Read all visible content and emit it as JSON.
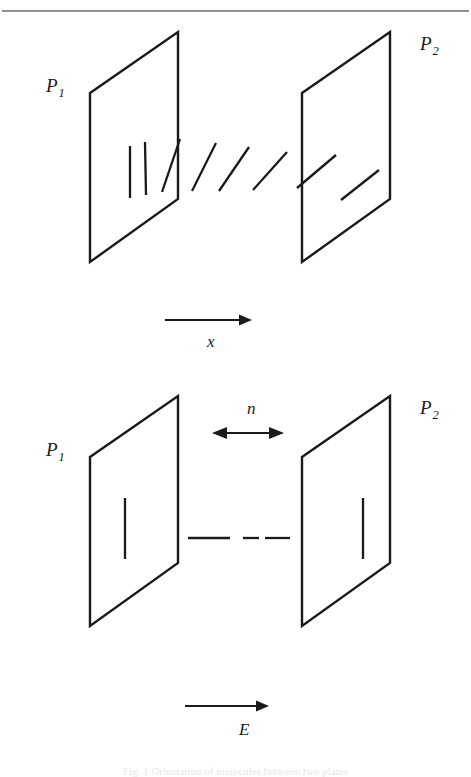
{
  "figure": {
    "width": 471,
    "height": 777,
    "background": "#ffffff",
    "ink_color": "#1a1a1a",
    "rule_color": "#6e6e6e",
    "top_rule": {
      "y": 11,
      "x1": 2,
      "x2": 469
    },
    "cut_caption": {
      "text": "Fig. 1   Orientation of molecules between two plates",
      "y": 765
    }
  },
  "panels": [
    {
      "id": "top-panel",
      "name": "splayed-orientation-panel",
      "plane_left": {
        "label": "P",
        "subscript": "1",
        "label_x": 46,
        "label_y": 92,
        "points": "90,93 178,32 178,199 90,262"
      },
      "plane_right": {
        "label": "P",
        "subscript": "2",
        "label_x": 420,
        "label_y": 50,
        "points": "302,93 390,32 390,199 302,262"
      },
      "axis_arrow": {
        "label": "x",
        "label_x": 207,
        "label_y": 347,
        "x1": 165,
        "x2": 245,
        "y": 320
      },
      "molecules": [
        {
          "x1": 130,
          "y1": 146,
          "x2": 130,
          "y2": 198,
          "angle_deg": 0
        },
        {
          "x1": 145,
          "y1": 142,
          "x2": 146,
          "y2": 195,
          "angle_deg": 1
        },
        {
          "x1": 162,
          "y1": 192,
          "x2": 180,
          "y2": 139,
          "angle_deg": 19
        },
        {
          "x1": 192,
          "y1": 191,
          "x2": 216,
          "y2": 143,
          "angle_deg": 27
        },
        {
          "x1": 219,
          "y1": 191,
          "x2": 249,
          "y2": 147,
          "angle_deg": 34
        },
        {
          "x1": 253,
          "y1": 190,
          "x2": 287,
          "y2": 152,
          "angle_deg": 42
        },
        {
          "x1": 297,
          "y1": 188,
          "x2": 336,
          "y2": 155,
          "angle_deg": 40
        },
        {
          "x1": 341,
          "y1": 200,
          "x2": 379,
          "y2": 170,
          "angle_deg": 38
        }
      ]
    },
    {
      "id": "bottom-panel",
      "name": "aligned-field-panel",
      "plane_left": {
        "label": "P",
        "subscript": "1",
        "label_x": 46,
        "label_y": 456,
        "points": "90,457 178,396 178,563 90,626"
      },
      "plane_right": {
        "label": "P",
        "subscript": "2",
        "label_x": 420,
        "label_y": 414,
        "points": "302,457 390,396 390,563 302,626"
      },
      "axis_arrow": {
        "label": "E",
        "label_x": 239,
        "label_y": 735,
        "x1": 185,
        "x2": 262,
        "y": 706
      },
      "normal_arrow": {
        "label": "n",
        "label_x": 247,
        "label_y": 414,
        "x1": 214,
        "x2": 282,
        "y": 433
      },
      "molecules": [
        {
          "x1": 125,
          "y1": 498,
          "x2": 125,
          "y2": 559,
          "angle_deg": 0
        },
        {
          "x1": 363,
          "y1": 498,
          "x2": 363,
          "y2": 559,
          "angle_deg": 0
        }
      ],
      "dashes": [
        {
          "x1": 188,
          "y1": 538,
          "x2": 230,
          "y2": 538
        },
        {
          "x1": 243,
          "y1": 538,
          "x2": 259,
          "y2": 538
        },
        {
          "x1": 265,
          "y1": 538,
          "x2": 290,
          "y2": 538
        }
      ]
    }
  ]
}
